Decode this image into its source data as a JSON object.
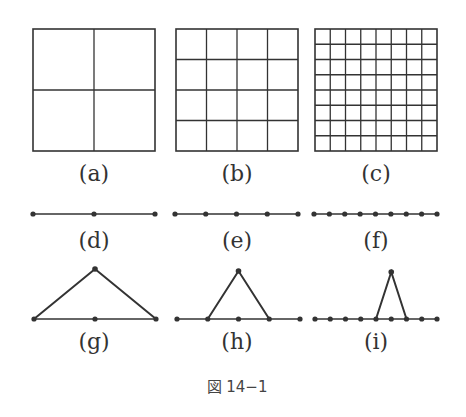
{
  "figure": {
    "caption": "図 14−1",
    "stroke_color": "#333333",
    "panels": {
      "a": {
        "label": "(a)",
        "type": "grid",
        "divisions": 2
      },
      "b": {
        "label": "(b)",
        "type": "grid",
        "divisions": 4
      },
      "c": {
        "label": "(c)",
        "type": "grid",
        "divisions": 8
      },
      "d": {
        "label": "(d)",
        "type": "line-nodes",
        "nodes": 3
      },
      "e": {
        "label": "(e)",
        "type": "line-nodes",
        "nodes": 5
      },
      "f": {
        "label": "(f)",
        "type": "line-nodes",
        "nodes": 9
      },
      "g": {
        "label": "(g)",
        "type": "hat-function",
        "nodes": 3,
        "peak_node": 1
      },
      "h": {
        "label": "(h)",
        "type": "hat-function",
        "nodes": 5,
        "peak_node": 2
      },
      "i": {
        "label": "(i)",
        "type": "hat-function",
        "nodes": 9,
        "peak_node": 5
      }
    }
  }
}
